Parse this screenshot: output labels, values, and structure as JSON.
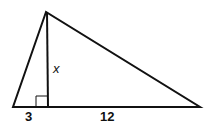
{
  "diagram": {
    "type": "geometry",
    "shape": "triangle with altitude",
    "labels": {
      "altitude": "x",
      "left_segment": "3",
      "right_segment": "12"
    },
    "right_angle_marker": true,
    "stroke_color": "#111111",
    "background": "#ffffff"
  }
}
